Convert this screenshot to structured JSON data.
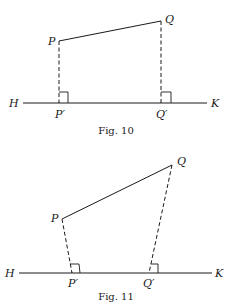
{
  "figures": [
    {
      "caption": "Fig. 10",
      "labels": {
        "P": "P",
        "Q": "Q",
        "H": "H",
        "K": "K",
        "P_foot": "P′",
        "Q_foot": "Q′"
      },
      "description": "Segment PQ above line HK with perpendicular projections P′ and Q′; PP′ and QQ′ parallel vertical dashed lines"
    },
    {
      "caption": "Fig. 11",
      "labels": {
        "P": "P",
        "Q": "Q",
        "H": "H",
        "K": "K",
        "P_foot": "P′",
        "Q_foot": "Q′"
      },
      "description": "Segment PQ above line HK with oblique projections P′ and Q′ drawn as dashed lines meeting HK"
    }
  ],
  "colors": {
    "stroke": "#1a1a1a",
    "background": "#ffffff"
  }
}
